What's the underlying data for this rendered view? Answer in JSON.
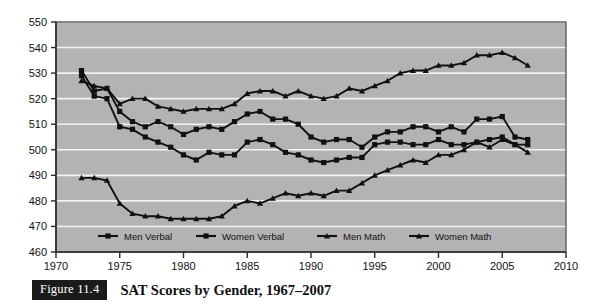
{
  "figure": {
    "tag_label": "Figure 11.4",
    "caption": "SAT Scores by Gender, 1967–2007",
    "tag_bg": "#1b1b1b",
    "tag_fg": "#ffffff"
  },
  "chart_data": {
    "type": "line",
    "title": "SAT Scores by Gender, 1967–2007",
    "xlabel": "",
    "ylabel": "",
    "xlim": [
      1970,
      2010
    ],
    "ylim": [
      460,
      550
    ],
    "xticks": [
      1970,
      1975,
      1980,
      1985,
      1990,
      1995,
      2000,
      2005,
      2010
    ],
    "yticks": [
      460,
      470,
      480,
      490,
      500,
      510,
      520,
      530,
      540,
      550
    ],
    "grid": "horizontal",
    "plot_bg": "#b3b3b3",
    "line_color": "#111111",
    "legend_position": "bottom",
    "x": [
      1972,
      1973,
      1974,
      1975,
      1976,
      1977,
      1978,
      1979,
      1980,
      1981,
      1982,
      1983,
      1984,
      1985,
      1986,
      1987,
      1988,
      1989,
      1990,
      1991,
      1992,
      1993,
      1994,
      1995,
      1996,
      1997,
      1998,
      1999,
      2000,
      2001,
      2002,
      2003,
      2004,
      2005,
      2006,
      2007
    ],
    "series": [
      {
        "name": "Men Verbal",
        "marker": "square",
        "values": [
          531,
          523,
          524,
          515,
          511,
          509,
          511,
          509,
          506,
          508,
          509,
          508,
          511,
          514,
          515,
          512,
          512,
          510,
          505,
          503,
          504,
          504,
          501,
          505,
          507,
          507,
          509,
          509,
          507,
          509,
          507,
          512,
          512,
          513,
          505,
          504
        ]
      },
      {
        "name": "Women Verbal",
        "marker": "square",
        "values": [
          529,
          521,
          520,
          509,
          508,
          505,
          503,
          501,
          498,
          496,
          499,
          498,
          498,
          503,
          504,
          502,
          499,
          498,
          496,
          495,
          496,
          497,
          497,
          502,
          503,
          503,
          502,
          502,
          504,
          502,
          502,
          503,
          504,
          505,
          502,
          502
        ]
      },
      {
        "name": "Men Math",
        "marker": "triangle",
        "values": [
          527,
          525,
          524,
          518,
          520,
          520,
          517,
          516,
          515,
          516,
          516,
          516,
          518,
          522,
          523,
          523,
          521,
          523,
          521,
          520,
          521,
          524,
          523,
          525,
          527,
          530,
          531,
          531,
          533,
          533,
          534,
          537,
          537,
          538,
          536,
          533
        ]
      },
      {
        "name": "Women Math",
        "marker": "triangle",
        "values": [
          489,
          489,
          488,
          479,
          475,
          474,
          474,
          473,
          473,
          473,
          473,
          474,
          478,
          480,
          479,
          481,
          483,
          482,
          483,
          482,
          484,
          484,
          487,
          490,
          492,
          494,
          496,
          495,
          498,
          498,
          500,
          503,
          501,
          504,
          502,
          499
        ]
      }
    ],
    "legend": [
      {
        "label": "Men Verbal",
        "marker": "square"
      },
      {
        "label": "Women Verbal",
        "marker": "square"
      },
      {
        "label": "Men Math",
        "marker": "triangle"
      },
      {
        "label": "Women Math",
        "marker": "triangle"
      }
    ]
  }
}
